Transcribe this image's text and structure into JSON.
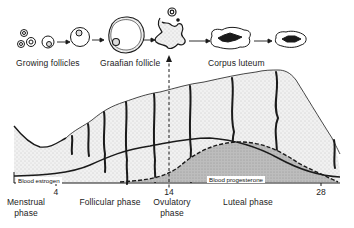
{
  "stages": {
    "growing": "Growing follicles",
    "graafian": "Graafian follicle",
    "corpus": "Corpus luteum"
  },
  "curves": {
    "estrogen": "Blood estrogen",
    "progesterone": "Blood progesterone"
  },
  "axis": {
    "ticks": [
      "4",
      "14",
      "28"
    ]
  },
  "phases": {
    "menstrual_line1": "Menstrual",
    "menstrual_line2": "phase",
    "follicular": "Follicular phase",
    "ovulatory_line1": "Ovulatory",
    "ovulatory_line2": "phase",
    "luteal": "Luteal phase"
  },
  "colors": {
    "ink": "#1a1a1a",
    "stipple": "#d9d9d9",
    "progesterone_fill": "#b5b5b5"
  }
}
